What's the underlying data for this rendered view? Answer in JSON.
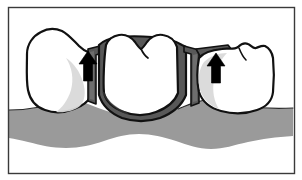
{
  "figure": {
    "frame": {
      "border_color": "#3a3a3a",
      "border_width": 1,
      "background": "#ffffff",
      "x": 8,
      "y": 7,
      "width": 286,
      "height": 166
    },
    "canvas": {
      "width": 302,
      "height": 180
    }
  },
  "colors": {
    "outline": "#111111",
    "tooth_fill": "#ffffff",
    "tooth_shadow": "#d9d9d9",
    "gum_fill": "#9a9a9a",
    "metal_framework": "#585858",
    "arrow_fill": "#000000",
    "background": "#ffffff"
  },
  "elements": {
    "left_abutment": {
      "label": "Left abutment crown",
      "fill": "#ffffff",
      "shadow_fill": "#d9d9d9"
    },
    "pontic": {
      "label": "Pontic with metal framework",
      "fill": "#ffffff",
      "framework_fill": "#585858"
    },
    "right_abutment": {
      "label": "Right abutment crown",
      "fill": "#ffffff",
      "shadow_fill": "#d9d9d9"
    },
    "gingiva": {
      "label": "Gingival tissue band",
      "fill": "#9a9a9a"
    },
    "connector_left": {
      "label": "Left connector / metal collar",
      "fill": "#585858"
    },
    "connector_right": {
      "label": "Right connector / metal collar",
      "fill": "#585858"
    },
    "arrow_left": {
      "label": "Upward seating force arrow (left)",
      "direction": "up",
      "fill": "#000000"
    },
    "arrow_right": {
      "label": "Upward seating force arrow (right)",
      "direction": "up",
      "fill": "#000000"
    }
  },
  "accessibility": {
    "alt_text": "Line drawing of a three-unit fixed dental bridge: two abutment crowns flank a central pontic with a dark metal framework, resting above a gray band of gingival tissue; two black arrows point upward at the connector areas."
  }
}
